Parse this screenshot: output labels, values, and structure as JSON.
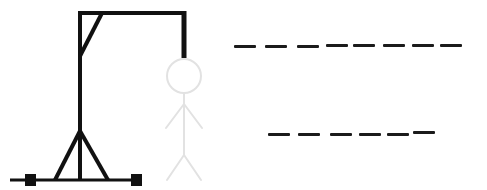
{
  "game": {
    "name": "Hangman",
    "colors": {
      "gallows": "#111111",
      "figure": "#e4e4e4",
      "blanks": "#1b1b1b",
      "background": "#ffffff"
    },
    "figure_parts_shown": [
      "head",
      "body",
      "left-arm",
      "right-arm",
      "left-leg",
      "right-leg"
    ],
    "word_rows": [
      {
        "row": 1,
        "blank_count": 8,
        "letters": [
          "",
          "",
          "",
          "",
          "",
          "",
          "",
          ""
        ]
      },
      {
        "row": 2,
        "blank_count": 6,
        "letters": [
          "",
          "",
          "",
          "",
          "",
          ""
        ]
      }
    ]
  }
}
